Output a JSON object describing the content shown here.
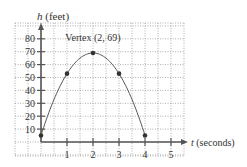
{
  "chart_data": {
    "type": "line",
    "title": "",
    "xlabel": "t (seconds)",
    "ylabel": "h (feet)",
    "xlabel_var": "t",
    "xlabel_unit": "(seconds)",
    "ylabel_var": "h",
    "ylabel_unit": "(feet)",
    "xlim": [
      -1,
      5.7
    ],
    "ylim": [
      -11,
      92
    ],
    "x_ticks": [
      1,
      2,
      3,
      4,
      5
    ],
    "y_ticks": [
      10,
      20,
      30,
      40,
      50,
      60,
      70,
      80
    ],
    "grid": true,
    "curve": "h = -16t^2 + 64t + 5",
    "series": [
      {
        "name": "height",
        "points": [
          {
            "t": 0,
            "h": 5
          },
          {
            "t": 1,
            "h": 53
          },
          {
            "t": 2,
            "h": 69
          },
          {
            "t": 3,
            "h": 53
          },
          {
            "t": 4,
            "h": 5
          }
        ]
      }
    ],
    "annotations": [
      {
        "text": "Vertex (2, 69)",
        "x": 2,
        "y": 69
      }
    ],
    "legend": null
  },
  "colors": {
    "axis": "#555555",
    "grid": "#9a9a9a",
    "curve": "#555555",
    "dot": "#333333",
    "text": "#333333"
  }
}
